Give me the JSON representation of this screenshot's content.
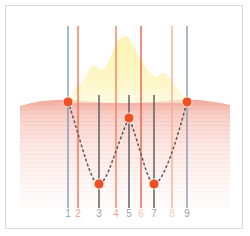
{
  "figure": {
    "title_visible": false,
    "background_color": "#ffffff",
    "card_border_color": "#d8d8d8"
  },
  "chart_data": {
    "type": "line",
    "title": "",
    "subtitle": "",
    "xlabel": "",
    "ylabel": "",
    "xlim": [
      0,
      238
    ],
    "ylim": [
      224,
      0
    ],
    "grid": false,
    "legend": "none",
    "axis_tick_labels": [
      "1",
      "2",
      "3",
      "4",
      "5",
      "6",
      "7",
      "8",
      "9"
    ],
    "tick_label_colors": [
      "#8fa3bd",
      "#f0a08c",
      "#9aa0a6",
      "#f4a58f",
      "#9aa0a6",
      "#f6c0ae",
      "#9aa0a6",
      "#f8cdbb",
      "#9aa0a6"
    ],
    "vertical_lines": [
      {
        "id": "1",
        "x": 62,
        "y_top": 20,
        "y_bottom": 202,
        "color": "#7d93b0",
        "width": 1.3,
        "style": "solid",
        "group": "outer-blue"
      },
      {
        "id": "2",
        "x": 72,
        "y_top": 20,
        "y_bottom": 202,
        "color": "#f0694a",
        "width": 1.3,
        "style": "solid",
        "group": "boundary-orange"
      },
      {
        "id": "3",
        "x": 93,
        "y_top": 89,
        "y_bottom": 202,
        "color": "#55585a",
        "width": 1.4,
        "style": "solid",
        "group": "probe-dark"
      },
      {
        "id": "4",
        "x": 110,
        "y_top": 20,
        "y_bottom": 202,
        "color": "#f4794f",
        "width": 1.3,
        "style": "solid",
        "group": "boundary-orange"
      },
      {
        "id": "5",
        "x": 123,
        "y_top": 89,
        "y_bottom": 202,
        "color": "#55585a",
        "width": 1.4,
        "style": "solid",
        "group": "probe-dark"
      },
      {
        "id": "6",
        "x": 135,
        "y_top": 20,
        "y_bottom": 202,
        "color": "#e8553a",
        "width": 1.3,
        "style": "solid",
        "group": "boundary-orange"
      },
      {
        "id": "7",
        "x": 148,
        "y_top": 89,
        "y_bottom": 202,
        "color": "#55585a",
        "width": 1.4,
        "style": "solid",
        "group": "probe-dark"
      },
      {
        "id": "8",
        "x": 166,
        "y_top": 20,
        "y_bottom": 202,
        "color": "#f6ab8e",
        "width": 1.3,
        "style": "solid",
        "group": "boundary-orange"
      },
      {
        "id": "9",
        "x": 181,
        "y_top": 20,
        "y_bottom": 202,
        "color": "#7d93b0",
        "width": 1.3,
        "style": "solid",
        "group": "outer-blue"
      }
    ],
    "markers": {
      "name": "red-markers",
      "shape": "circle",
      "radius": 5,
      "fill": "#f04e23",
      "stroke": "#ffffff",
      "points": [
        {
          "x": 62,
          "y": 96,
          "line_id": "1"
        },
        {
          "x": 93,
          "y": 178,
          "line_id": "3"
        },
        {
          "x": 123,
          "y": 112,
          "line_id": "5"
        },
        {
          "x": 148,
          "y": 178,
          "line_id": "7"
        },
        {
          "x": 181,
          "y": 96,
          "line_id": "9"
        }
      ]
    },
    "dotted_curve": {
      "name": "w-shaped-connector",
      "color": "#6b5a58",
      "width": 1.6,
      "dash": "1.6 3.4",
      "path": "M 62 96 C 70 118, 78 152, 86 170 C 89 177, 91 178, 93 178 C 96 178, 99 173, 103 164 C 110 146, 117 124, 123 112 C 128 123, 134 146, 140 164 C 143 173, 146 178, 148 178 C 151 178, 154 174, 158 166 C 167 147, 175 118, 181 96"
    },
    "yellow_mass": {
      "name": "tumor-mass",
      "fill": "#fdf2a8",
      "opacity": 0.85,
      "baseline_y": 97,
      "path": "M 62 97 L 64 90 L 66 86 L 69 82 L 72 80 L 75 78 L 78 73 L 81 68 L 84 62 L 87 59 L 90 60 L 93 63 L 96 64 L 99 62 L 102 57 L 105 50 L 108 43 L 111 37 L 114 33 L 117 31 L 120 30 L 123 32 L 126 37 L 129 43 L 132 49 L 135 54 L 138 58 L 141 63 L 144 67 L 147 70 L 150 71 L 153 69 L 156 67 L 159 67 L 162 70 L 165 74 L 168 78 L 171 82 L 174 86 L 177 90 L 180 94 L 182 97 Z"
    },
    "tissue_band": {
      "name": "tissue-gradient",
      "top_y": 93,
      "bottom_y": 202,
      "top_color": "#f2b0a4",
      "mid_color": "#fadcd6",
      "bottom_color": "#fdf1ee",
      "surface_path": "M 14 100 C 30 95, 48 93, 66 94 C 84 95, 100 97, 118 97 C 136 97, 154 95, 172 94 C 190 93, 208 95, 224 99 L 224 202 L 14 202 Z",
      "striation_count": 26,
      "striation_color": "#f3a99c"
    }
  },
  "labels": {
    "ticks": [
      {
        "text": "1",
        "x": 62,
        "color": "#8fa3bd"
      },
      {
        "text": "2",
        "x": 72,
        "color": "#f0a08c"
      },
      {
        "text": "3",
        "x": 93,
        "color": "#9aa0a6"
      },
      {
        "text": "4",
        "x": 110,
        "color": "#f4a58f"
      },
      {
        "text": "5",
        "x": 123,
        "color": "#9aa0a6"
      },
      {
        "text": "6",
        "x": 135,
        "color": "#f6c0ae"
      },
      {
        "text": "7",
        "x": 148,
        "color": "#9aa0a6"
      },
      {
        "text": "8",
        "x": 166,
        "color": "#f8cdbb"
      },
      {
        "text": "9",
        "x": 181,
        "color": "#9aa0a6"
      }
    ]
  }
}
